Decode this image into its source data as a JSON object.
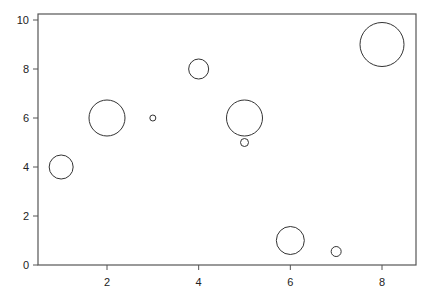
{
  "chart_data": {
    "type": "scatter",
    "subtype": "bubble",
    "title": "",
    "xlabel": "",
    "ylabel": "",
    "xlim": [
      0.35,
      8.6
    ],
    "ylim": [
      0,
      10.2
    ],
    "x_ticks": [
      2,
      4,
      6,
      8
    ],
    "y_ticks": [
      0,
      2,
      4,
      6,
      8,
      10
    ],
    "grid": false,
    "legend": null,
    "points": [
      {
        "x": 1,
        "y": 4,
        "size": 12
      },
      {
        "x": 2,
        "y": 6,
        "size": 18
      },
      {
        "x": 3,
        "y": 6,
        "size": 3
      },
      {
        "x": 4,
        "y": 8,
        "size": 10
      },
      {
        "x": 5,
        "y": 6,
        "size": 18
      },
      {
        "x": 5,
        "y": 5,
        "size": 4
      },
      {
        "x": 6,
        "y": 1,
        "size": 14
      },
      {
        "x": 7,
        "y": 0.55,
        "size": 5
      },
      {
        "x": 8,
        "y": 9,
        "size": 22
      }
    ],
    "marker": {
      "fill": "none",
      "stroke": "#333333"
    }
  }
}
